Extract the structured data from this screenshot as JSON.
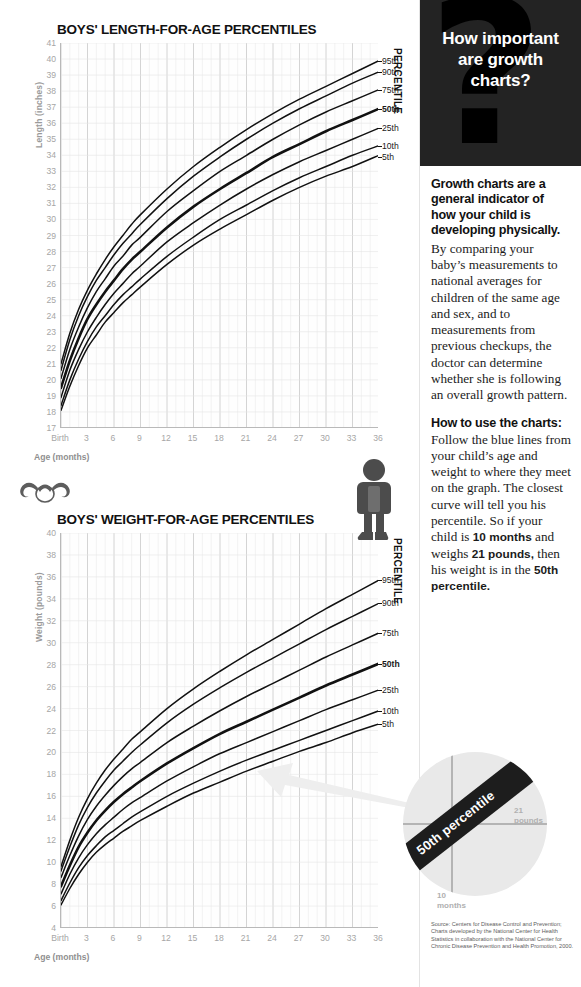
{
  "charts": [
    {
      "title": "BOYS' LENGTH-FOR-AGE PERCENTILES",
      "ylabel": "Length (inches)",
      "xlabel": "Age (months)",
      "percentile_title": "PERCENTILE"
    },
    {
      "title": "BOYS' WEIGHT-FOR-AGE PERCENTILES",
      "ylabel": "Weight (pounds)",
      "xlabel": "Age (months)",
      "percentile_title": "PERCENTILE"
    }
  ],
  "sidebar": {
    "header_title": "How important are growth charts?",
    "qmark": "?",
    "lead": "Growth charts are a general indicator of how your child is developing physically.",
    "body": "By comparing your baby’s measurements to national averages for children of the same age and sex, and to measurements from previous checkups, the doctor can determine whether she is following an overall growth pattern.",
    "subhead": "How to use the charts:",
    "howto_1": "Follow the blue lines from your child’s age and weight to where they meet on the graph. The closest curve will tell you his percentile. So if your child is ",
    "howto_b1": "10 months",
    "howto_2": " and weighs ",
    "howto_b2": "21 pounds,",
    "howto_3": " then his weight is in the ",
    "howto_b3": "50th percentile.",
    "source": "Source: Centers for Disease Control  and Prevention; Charts developed by the National Center for Health Statistics in collaboration with the National Center for Chronic Disease Prevention and Health Promotion, 2000."
  },
  "magnifier": {
    "band_text": "50th percentile",
    "label_weight_value": "21",
    "label_weight_unit": "pounds",
    "label_age_value": "10",
    "label_age_unit": "months"
  },
  "colors": {
    "header_bg": "#232323",
    "curve": "#111111",
    "grid_minor": "#e6e6e6",
    "grid_major": "#c9c9c9",
    "tick_text": "#a6a6a6",
    "magnifier_fill": "#e9e9e9",
    "band": "#1d1d1d"
  },
  "chart_data": [
    {
      "type": "line",
      "title": "BOYS' LENGTH-FOR-AGE PERCENTILES",
      "xlabel": "Age (months)",
      "ylabel": "Length (inches)",
      "xlim": [
        0,
        36
      ],
      "ylim": [
        17,
        41
      ],
      "yticks": [
        17,
        18,
        19,
        20,
        21,
        22,
        23,
        24,
        25,
        26,
        27,
        28,
        29,
        30,
        31,
        32,
        33,
        34,
        35,
        36,
        37,
        38,
        39,
        40,
        41
      ],
      "xticks": [
        0,
        3,
        6,
        9,
        12,
        15,
        18,
        21,
        24,
        27,
        30,
        33,
        36
      ],
      "xticklabels": [
        "Birth",
        "3",
        "6",
        "9",
        "12",
        "15",
        "18",
        "21",
        "24",
        "27",
        "30",
        "33",
        "36"
      ],
      "grid": true,
      "legend_position": "right",
      "legend_title": "PERCENTILE",
      "x": [
        0,
        1,
        2,
        3,
        4,
        5,
        6,
        7,
        8,
        9,
        12,
        15,
        18,
        21,
        24,
        27,
        30,
        33,
        36
      ],
      "series": [
        {
          "name": "95th",
          "values": [
            21.0,
            22.9,
            24.4,
            25.6,
            26.6,
            27.5,
            28.3,
            29.0,
            29.7,
            30.3,
            31.9,
            33.3,
            34.5,
            35.6,
            36.6,
            37.5,
            38.3,
            39.1,
            39.9
          ],
          "emphasis": false
        },
        {
          "name": "90th",
          "values": [
            20.6,
            22.5,
            24.0,
            25.2,
            26.2,
            27.0,
            27.8,
            28.5,
            29.1,
            29.7,
            31.3,
            32.7,
            33.9,
            35.0,
            36.0,
            36.9,
            37.7,
            38.5,
            39.2
          ],
          "emphasis": false
        },
        {
          "name": "75th",
          "values": [
            20.1,
            21.9,
            23.3,
            24.5,
            25.5,
            26.3,
            27.1,
            27.7,
            28.4,
            28.9,
            30.5,
            31.8,
            33.0,
            34.0,
            35.0,
            35.9,
            36.7,
            37.4,
            38.1
          ],
          "emphasis": false
        },
        {
          "name": "50th",
          "values": [
            19.5,
            21.2,
            22.6,
            23.8,
            24.7,
            25.5,
            26.2,
            26.9,
            27.5,
            28.0,
            29.5,
            30.8,
            31.9,
            32.9,
            33.9,
            34.7,
            35.5,
            36.2,
            36.9
          ],
          "emphasis": true
        },
        {
          "name": "25th",
          "values": [
            18.9,
            20.6,
            21.9,
            23.0,
            23.9,
            24.7,
            25.4,
            26.0,
            26.6,
            27.1,
            28.6,
            29.8,
            30.9,
            31.9,
            32.8,
            33.6,
            34.3,
            35.0,
            35.7
          ],
          "emphasis": false
        },
        {
          "name": "10th",
          "values": [
            18.4,
            20.0,
            21.3,
            22.4,
            23.3,
            24.0,
            24.7,
            25.3,
            25.8,
            26.3,
            27.7,
            28.9,
            30.0,
            30.9,
            31.8,
            32.6,
            33.3,
            34.0,
            34.6
          ],
          "emphasis": false
        },
        {
          "name": "5th",
          "values": [
            18.1,
            19.6,
            20.9,
            22.0,
            22.8,
            23.6,
            24.2,
            24.8,
            25.3,
            25.8,
            27.2,
            28.4,
            29.4,
            30.3,
            31.2,
            32.0,
            32.7,
            33.3,
            34.0
          ],
          "emphasis": false
        }
      ]
    },
    {
      "type": "line",
      "title": "BOYS' WEIGHT-FOR-AGE PERCENTILES",
      "xlabel": "Age (months)",
      "ylabel": "Weight (pounds)",
      "xlim": [
        0,
        36
      ],
      "ylim": [
        4,
        40
      ],
      "yticks": [
        4,
        6,
        8,
        10,
        12,
        14,
        16,
        18,
        20,
        22,
        24,
        26,
        28,
        30,
        32,
        34,
        36,
        38,
        40
      ],
      "xticks": [
        0,
        3,
        6,
        9,
        12,
        15,
        18,
        21,
        24,
        27,
        30,
        33,
        36
      ],
      "xticklabels": [
        "Birth",
        "3",
        "6",
        "9",
        "12",
        "15",
        "18",
        "21",
        "24",
        "27",
        "30",
        "33",
        "36"
      ],
      "grid": true,
      "legend_position": "right",
      "legend_title": "PERCENTILE",
      "x": [
        0,
        1,
        2,
        3,
        4,
        5,
        6,
        7,
        8,
        9,
        12,
        15,
        18,
        21,
        24,
        27,
        30,
        33,
        36
      ],
      "series": [
        {
          "name": "95th",
          "values": [
            9.6,
            12.0,
            14.1,
            15.8,
            17.2,
            18.4,
            19.4,
            20.3,
            21.2,
            21.9,
            24.0,
            25.8,
            27.4,
            28.9,
            30.3,
            31.7,
            33.1,
            34.4,
            35.7
          ],
          "emphasis": false
        },
        {
          "name": "90th",
          "values": [
            9.2,
            11.4,
            13.4,
            15.0,
            16.3,
            17.4,
            18.4,
            19.2,
            20.0,
            20.7,
            22.7,
            24.4,
            25.9,
            27.3,
            28.6,
            29.9,
            31.2,
            32.4,
            33.6
          ],
          "emphasis": false
        },
        {
          "name": "75th",
          "values": [
            8.6,
            10.6,
            12.4,
            13.9,
            15.1,
            16.1,
            17.0,
            17.8,
            18.5,
            19.1,
            20.9,
            22.4,
            23.8,
            25.1,
            26.3,
            27.5,
            28.7,
            29.8,
            30.9
          ],
          "emphasis": false
        },
        {
          "name": "50th",
          "values": [
            7.8,
            9.7,
            11.4,
            12.7,
            13.8,
            14.7,
            15.5,
            16.2,
            16.8,
            17.4,
            19.0,
            20.4,
            21.7,
            22.8,
            23.9,
            25.0,
            26.1,
            27.1,
            28.1
          ],
          "emphasis": true
        },
        {
          "name": "25th",
          "values": [
            7.1,
            8.9,
            10.4,
            11.6,
            12.6,
            13.4,
            14.1,
            14.8,
            15.4,
            15.9,
            17.4,
            18.7,
            19.9,
            20.9,
            21.9,
            22.9,
            23.9,
            24.8,
            25.7
          ],
          "emphasis": false
        },
        {
          "name": "10th",
          "values": [
            6.5,
            8.1,
            9.5,
            10.6,
            11.5,
            12.3,
            12.9,
            13.5,
            14.1,
            14.6,
            16.0,
            17.2,
            18.3,
            19.3,
            20.2,
            21.1,
            22.0,
            22.9,
            23.8
          ],
          "emphasis": false
        },
        {
          "name": "5th",
          "values": [
            6.1,
            7.6,
            8.9,
            10.0,
            10.9,
            11.6,
            12.2,
            12.8,
            13.3,
            13.8,
            15.1,
            16.3,
            17.3,
            18.3,
            19.2,
            20.1,
            20.9,
            21.8,
            22.6
          ],
          "emphasis": false
        }
      ]
    }
  ]
}
